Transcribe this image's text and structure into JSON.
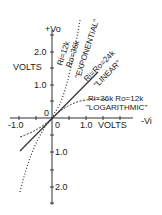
{
  "axes": {
    "y_top_label": "+Vo",
    "y_units": "VOLTS",
    "x_right_label": "-Vi",
    "x_units": "VOLTS",
    "origin_label_left": "0",
    "origin_label_below": "0",
    "x_ticks": [
      "-1.0",
      "1.0"
    ],
    "y_ticks_upper": [
      "2.0",
      "1.0"
    ],
    "y_ticks_lower": [
      "1.0",
      "2.0"
    ]
  },
  "curves": [
    {
      "name": "exponential",
      "params": "Ri=12k",
      "params2": "Ro=36k",
      "label": "\"EXPONENTIAL\"",
      "style": "dotted"
    },
    {
      "name": "linear",
      "params": "Ri=Ro=24k",
      "label": "\"LINEAR\"",
      "style": "solid"
    },
    {
      "name": "logarithmic",
      "params": "Ri=36k Ro=12k",
      "label": "\"LOGARITHMIC\"",
      "style": "dashed"
    }
  ],
  "colors": {
    "ink": "#222222",
    "background": "#ffffff"
  }
}
